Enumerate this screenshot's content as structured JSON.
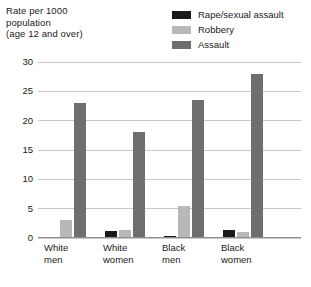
{
  "chart_data": {
    "type": "bar",
    "title": "",
    "subtitle": "",
    "ylabel": "Rate per 1000\npopulation\n(age 12 and over)",
    "xlabel": "",
    "categories": [
      "White\nmen",
      "White\nwomen",
      "Black\nmen",
      "Black\nwomen"
    ],
    "series": [
      {
        "name": "Rape/sexual assault",
        "color": "#1a1a1a",
        "values": [
          0.2,
          1.2,
          0.3,
          1.3
        ]
      },
      {
        "name": "Robbery",
        "color": "#b8b8b8",
        "values": [
          3.0,
          1.3,
          5.5,
          1.0
        ]
      },
      {
        "name": "Assault",
        "color": "#6e6e6e",
        "values": [
          23.0,
          18.0,
          23.5,
          28.0
        ]
      }
    ],
    "ylim": [
      0,
      30
    ],
    "yticks": [
      0,
      5,
      10,
      15,
      20,
      25,
      30
    ],
    "ytick_labels": [
      "0",
      "5",
      "10",
      "15",
      "20",
      "25",
      "30"
    ],
    "grid": "horizontal",
    "legend_position": "top-right"
  },
  "legend": {
    "items": [
      {
        "label": "Rape/sexual assault",
        "color": "#1a1a1a"
      },
      {
        "label": "Robbery",
        "color": "#b8b8b8"
      },
      {
        "label": "Assault",
        "color": "#6e6e6e"
      }
    ]
  },
  "axis": {
    "y_title": "Rate per 1000\npopulation\n(age 12 and over)"
  }
}
